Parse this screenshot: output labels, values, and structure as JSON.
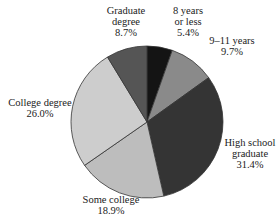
{
  "chart_data": {
    "type": "pie",
    "title": "",
    "start": "12 o'clock",
    "direction": "clockwise",
    "slices": [
      {
        "label_lines": [
          "8 years",
          "or less"
        ],
        "label": "8 years or less",
        "value": 5.4,
        "value_label": "5.4%",
        "color": "#141414"
      },
      {
        "label_lines": [
          "9–11 years"
        ],
        "label": "9–11 years",
        "value": 9.7,
        "value_label": "9.7%",
        "color": "#8a8a8a"
      },
      {
        "label_lines": [
          "High school",
          "graduate"
        ],
        "label": "High school graduate",
        "value": 31.4,
        "value_label": "31.4%",
        "color": "#343434"
      },
      {
        "label_lines": [
          "Some college"
        ],
        "label": "Some college",
        "value": 18.9,
        "value_label": "18.9%",
        "color": "#bdbdbd"
      },
      {
        "label_lines": [
          "College degree"
        ],
        "label": "College degree",
        "value": 26.0,
        "value_label": "26.0%",
        "color": "#cdcdcd"
      },
      {
        "label_lines": [
          "Graduate",
          "degree"
        ],
        "label": "Graduate degree",
        "value": 8.7,
        "value_label": "8.7%",
        "color": "#555555"
      }
    ]
  }
}
